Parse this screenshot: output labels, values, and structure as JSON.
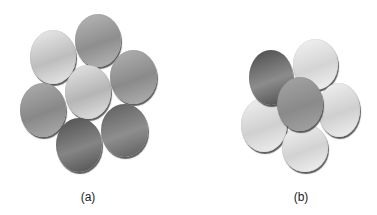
{
  "figure": {
    "panels": [
      {
        "label": "(a)",
        "label_pos": [
          88,
          190
        ],
        "discs": [
          {
            "name": "top",
            "cx": 98,
            "cy": 40,
            "w": 46,
            "h": 53,
            "tone": "mid",
            "c1": "#b8b8b8",
            "c2": "#8e8e8e",
            "z": 1
          },
          {
            "name": "upper-left",
            "cx": 53,
            "cy": 57,
            "w": 46,
            "h": 54,
            "tone": "light",
            "c1": "#ececec",
            "c2": "#bdbdbd",
            "z": 1
          },
          {
            "name": "upper-right",
            "cx": 133,
            "cy": 77,
            "w": 47,
            "h": 54,
            "tone": "mid",
            "c1": "#b3b3b3",
            "c2": "#8a8a8a",
            "z": 1
          },
          {
            "name": "center",
            "cx": 88,
            "cy": 92,
            "w": 46,
            "h": 54,
            "tone": "light",
            "c1": "#e6e6e6",
            "c2": "#b5b5b5",
            "z": 2
          },
          {
            "name": "lower-left",
            "cx": 43,
            "cy": 110,
            "w": 46,
            "h": 54,
            "tone": "mid",
            "c1": "#aeaeae",
            "c2": "#888888",
            "z": 1
          },
          {
            "name": "lower-right",
            "cx": 124,
            "cy": 130,
            "w": 47,
            "h": 53,
            "tone": "dark",
            "c1": "#5d5d5d",
            "c2": "#8e8e8e",
            "z": 1
          },
          {
            "name": "bottom",
            "cx": 79,
            "cy": 145,
            "w": 46,
            "h": 54,
            "tone": "dark",
            "c1": "#4f4f4f",
            "c2": "#858585",
            "z": 3
          }
        ]
      },
      {
        "label": "(b)",
        "label_pos": [
          301,
          190
        ],
        "discs": [
          {
            "name": "upper-right",
            "cx": 315,
            "cy": 64,
            "w": 45,
            "h": 51,
            "tone": "light",
            "c1": "#f4f4f4",
            "c2": "#d4d4d4",
            "z": 1
          },
          {
            "name": "upper-left",
            "cx": 271,
            "cy": 77,
            "w": 44,
            "h": 55,
            "tone": "dark",
            "c1": "#4a4a4a",
            "c2": "#8c8c8c",
            "z": 2
          },
          {
            "name": "right",
            "cx": 339,
            "cy": 110,
            "w": 42,
            "h": 54,
            "tone": "light",
            "c1": "#f2f2f2",
            "c2": "#cfcfcf",
            "z": 1
          },
          {
            "name": "left",
            "cx": 264,
            "cy": 125,
            "w": 46,
            "h": 54,
            "tone": "light",
            "c1": "#f2f2f2",
            "c2": "#d0d0d0",
            "z": 1
          },
          {
            "name": "bottom",
            "cx": 305,
            "cy": 148,
            "w": 46,
            "h": 48,
            "tone": "light",
            "c1": "#f4f4f4",
            "c2": "#d2d2d2",
            "z": 2
          },
          {
            "name": "center",
            "cx": 300,
            "cy": 104,
            "w": 46,
            "h": 54,
            "tone": "mid",
            "c1": "#a5a5a5",
            "c2": "#8a8a8a",
            "z": 4
          }
        ]
      }
    ]
  }
}
